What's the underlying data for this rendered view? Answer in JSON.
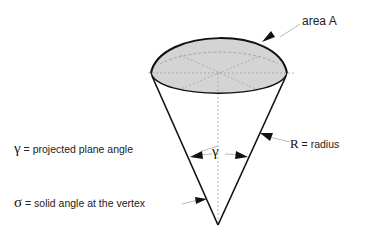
{
  "diagram": {
    "labels": {
      "area": {
        "symbol": "area A"
      },
      "gamma_def": {
        "symbol": "γ",
        "eq": "=",
        "text": "projected plane angle"
      },
      "sigma_def": {
        "symbol": "σ",
        "eq": "=",
        "text": "solid angle at the vertex"
      },
      "radius_def": {
        "symbol": "R",
        "eq": "=",
        "text": "radius"
      },
      "gamma_angle": "γ"
    },
    "colors": {
      "cap_fill": "#d4d4d4",
      "stroke": "#111111",
      "dashed": "#888888"
    }
  }
}
